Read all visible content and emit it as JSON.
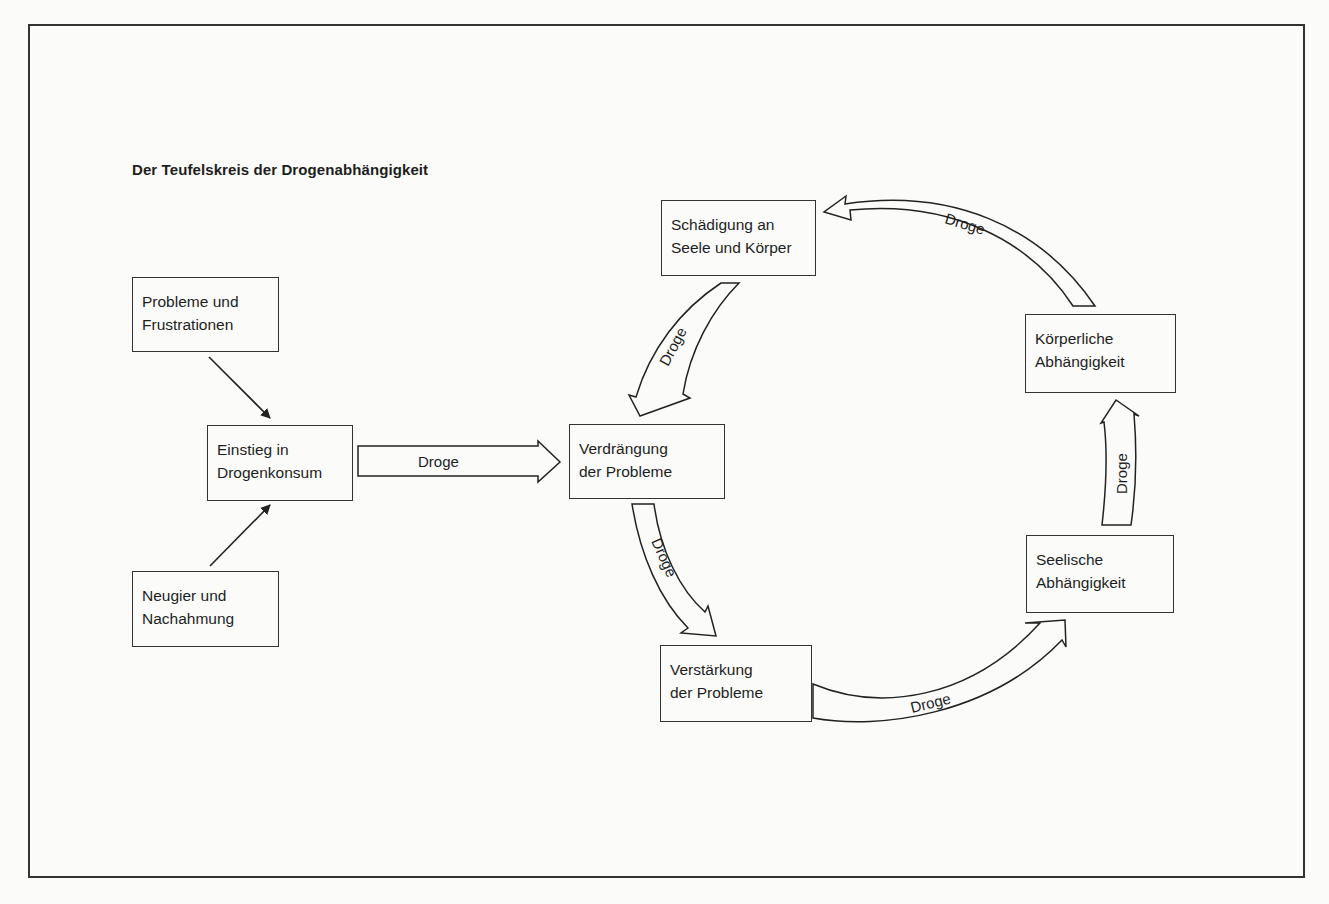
{
  "diagram": {
    "title": "Der Teufelskreis der Drogenabhängigkeit",
    "nodes": [
      {
        "id": "probleme",
        "lines": [
          "Probleme und",
          "Frustrationen"
        ]
      },
      {
        "id": "einstieg",
        "lines": [
          "Einstieg in",
          "Drogenkonsum"
        ]
      },
      {
        "id": "neugier",
        "lines": [
          "Neugier und",
          "Nachahmung"
        ]
      },
      {
        "id": "verdraengung",
        "lines": [
          "Verdrängung",
          "der Probleme"
        ]
      },
      {
        "id": "schaedigung",
        "lines": [
          "Schädigung an",
          "Seele und Körper"
        ]
      },
      {
        "id": "koerperlich",
        "lines": [
          "Körperliche",
          "Abhängigkeit"
        ]
      },
      {
        "id": "seelisch",
        "lines": [
          "Seelische",
          "Abhängigkeit"
        ]
      },
      {
        "id": "verstaerkung",
        "lines": [
          "Verstärkung",
          "der Probleme"
        ]
      }
    ],
    "edges": [
      {
        "from": "probleme",
        "to": "einstieg",
        "label": ""
      },
      {
        "from": "neugier",
        "to": "einstieg",
        "label": ""
      },
      {
        "from": "einstieg",
        "to": "verdraengung",
        "label": "Droge"
      },
      {
        "from": "verdraengung",
        "to": "verstaerkung",
        "label": "Droge"
      },
      {
        "from": "verstaerkung",
        "to": "seelisch",
        "label": "Droge"
      },
      {
        "from": "seelisch",
        "to": "koerperlich",
        "label": "Droge"
      },
      {
        "from": "koerperlich",
        "to": "schaedigung",
        "label": "Droge"
      },
      {
        "from": "schaedigung",
        "to": "verdraengung",
        "label": "Droge"
      }
    ]
  }
}
